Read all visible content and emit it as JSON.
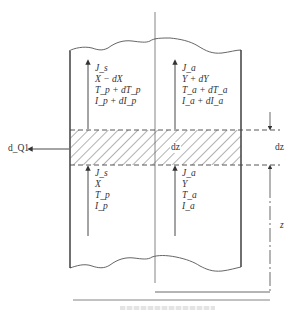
{
  "figure": {
    "type": "column-differential-element",
    "colors": {
      "line": "#444444",
      "hatch": "#555555",
      "text": "#333333"
    }
  },
  "upper_left_labels": [
    "J_s",
    "X − dX",
    "T_p + dT_p",
    "I_p + dI_p"
  ],
  "upper_right_labels": [
    "J_a",
    "Y + dY",
    "T_a + dT_a",
    "I_a + dI_a"
  ],
  "lower_left_labels": [
    "J_s",
    "X",
    "T_p",
    "I_p"
  ],
  "lower_right_labels": [
    "J_a",
    "Y",
    "T_a",
    "I_a"
  ],
  "labels": {
    "heat_loss": "d_Q1",
    "element_height_inside": "dz",
    "element_height_dim": "dz",
    "height_dim": "z"
  },
  "caption": {
    "legible": false
  }
}
